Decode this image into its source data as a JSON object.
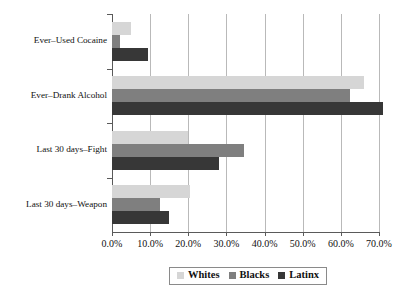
{
  "chart_data": {
    "type": "bar",
    "orientation": "horizontal",
    "title": "",
    "subtitle": "",
    "xlabel": "",
    "ylabel": "",
    "xlim": [
      0,
      70
    ],
    "xtick_labels": [
      "0.0%",
      "10.0%",
      "20.0%",
      "30.0%",
      "40.0%",
      "50.0%",
      "60.0%",
      "70.0%"
    ],
    "xtick_values": [
      0,
      10,
      20,
      30,
      40,
      50,
      60,
      70
    ],
    "grid": true,
    "legend_position": "bottom",
    "categories": [
      "Ever–Used Cocaine",
      "Ever–Drank Alcohol",
      "Last 30 days–Fight",
      "Last 30 days–Weapon"
    ],
    "series": [
      {
        "name": "Whites",
        "color": "#d6d6d6",
        "values": [
          5.0,
          66.0,
          20.0,
          20.5
        ]
      },
      {
        "name": "Blacks",
        "color": "#7f7f7f",
        "values": [
          2.0,
          62.5,
          34.5,
          12.5
        ]
      },
      {
        "name": "Latinx",
        "color": "#373737",
        "values": [
          9.5,
          71.0,
          28.0,
          15.0
        ]
      }
    ]
  }
}
